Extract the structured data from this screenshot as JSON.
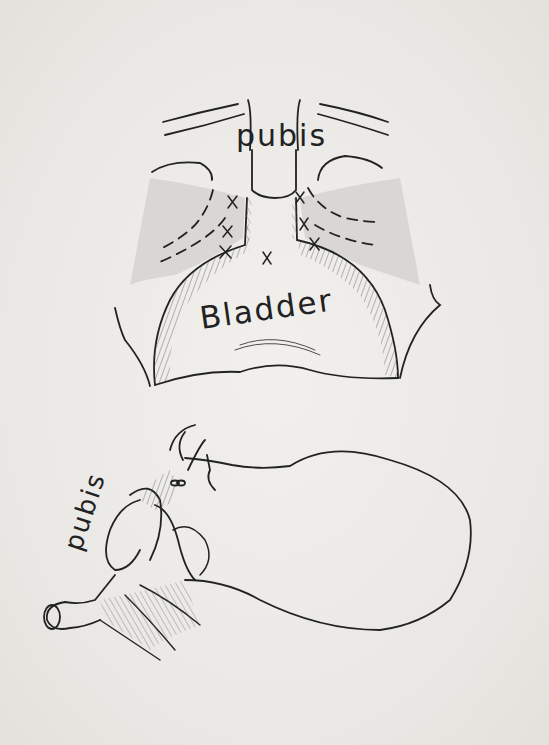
{
  "figure": {
    "top_view": {
      "labels": {
        "pubis": "pubis",
        "bladder": "Bladder"
      },
      "suture_marks": 7
    },
    "side_view": {
      "labels": {
        "pubis": "pubis"
      }
    }
  },
  "colors": {
    "ink": "#222222",
    "paper": "#ecebe8"
  }
}
